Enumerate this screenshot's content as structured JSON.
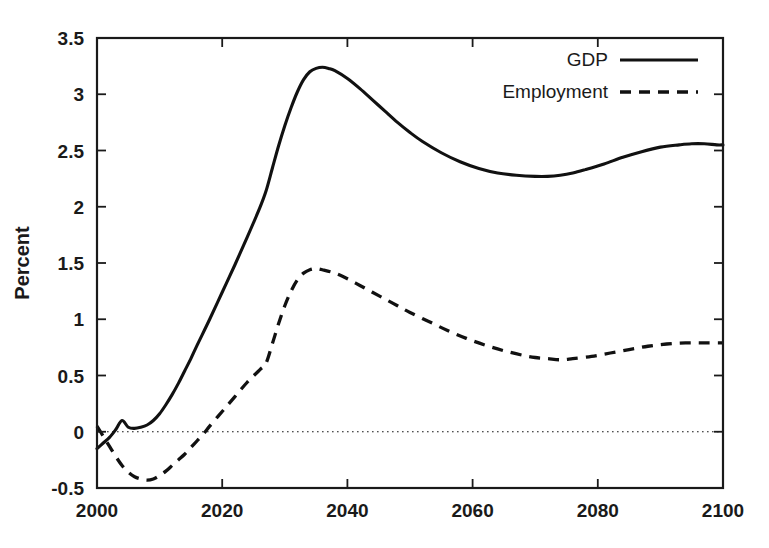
{
  "chart_data": {
    "type": "line",
    "title": "",
    "xlabel": "",
    "ylabel": "Percent",
    "xlim": [
      2000,
      2100
    ],
    "ylim": [
      -0.5,
      3.5
    ],
    "xticks": [
      2000,
      2020,
      2040,
      2060,
      2080,
      2100
    ],
    "xtick_labels": [
      "2000",
      "2020",
      "2040",
      "2060",
      "2080",
      "2100"
    ],
    "yticks": [
      -0.5,
      0,
      0.5,
      1,
      1.5,
      2,
      2.5,
      3,
      3.5
    ],
    "ytick_labels": [
      "-0.5",
      "0",
      "0.5",
      "1",
      "1.5",
      "2",
      "2.5",
      "3",
      "3.5"
    ],
    "grid": false,
    "zero_reference_line": {
      "value": 0,
      "style": "dotted"
    },
    "legend": {
      "position": "top-right",
      "entries": [
        {
          "name": "GDP",
          "style": "solid"
        },
        {
          "name": "Employment",
          "style": "dashed"
        }
      ]
    },
    "series": [
      {
        "name": "GDP",
        "style": "solid",
        "color": "#111111",
        "x": [
          2000,
          2001,
          2002,
          2003,
          2004,
          2005,
          2006,
          2007,
          2008,
          2009,
          2010,
          2011,
          2012,
          2013,
          2014,
          2015,
          2016,
          2018,
          2020,
          2022,
          2024,
          2026,
          2027,
          2028,
          2029,
          2030,
          2031,
          2032,
          2033,
          2034,
          2035,
          2036,
          2037,
          2038,
          2040,
          2042,
          2044,
          2046,
          2048,
          2050,
          2052,
          2055,
          2058,
          2061,
          2064,
          2067,
          2070,
          2072,
          2074,
          2076,
          2078,
          2081,
          2084,
          2087,
          2090,
          2093,
          2095,
          2097,
          2099,
          2100
        ],
        "y": [
          -0.15,
          -0.1,
          -0.05,
          0.02,
          0.1,
          0.04,
          0.03,
          0.04,
          0.06,
          0.1,
          0.16,
          0.24,
          0.33,
          0.43,
          0.54,
          0.65,
          0.77,
          1.0,
          1.24,
          1.48,
          1.73,
          1.99,
          2.14,
          2.34,
          2.54,
          2.72,
          2.88,
          3.02,
          3.13,
          3.2,
          3.23,
          3.24,
          3.23,
          3.21,
          3.14,
          3.05,
          2.95,
          2.85,
          2.75,
          2.66,
          2.58,
          2.48,
          2.4,
          2.34,
          2.3,
          2.28,
          2.27,
          2.27,
          2.28,
          2.3,
          2.33,
          2.38,
          2.44,
          2.49,
          2.53,
          2.55,
          2.56,
          2.56,
          2.55,
          2.55
        ]
      },
      {
        "name": "Employment",
        "style": "dashed",
        "color": "#111111",
        "x": [
          2000,
          2001,
          2002,
          2003,
          2004,
          2005,
          2006,
          2007,
          2008,
          2009,
          2010,
          2011,
          2012,
          2013,
          2014,
          2015,
          2016,
          2017,
          2018,
          2020,
          2022,
          2024,
          2026,
          2027,
          2028,
          2029,
          2030,
          2031,
          2032,
          2033,
          2034,
          2035,
          2036,
          2038,
          2040,
          2042,
          2044,
          2046,
          2048,
          2050,
          2053,
          2056,
          2059,
          2062,
          2065,
          2068,
          2070,
          2072,
          2074,
          2076,
          2079,
          2082,
          2085,
          2088,
          2091,
          2094,
          2097,
          2100
        ],
        "y": [
          0.05,
          -0.04,
          -0.13,
          -0.22,
          -0.3,
          -0.36,
          -0.4,
          -0.42,
          -0.43,
          -0.42,
          -0.39,
          -0.35,
          -0.3,
          -0.25,
          -0.2,
          -0.14,
          -0.08,
          -0.02,
          0.05,
          0.18,
          0.31,
          0.44,
          0.55,
          0.61,
          0.78,
          0.96,
          1.12,
          1.25,
          1.35,
          1.41,
          1.44,
          1.45,
          1.44,
          1.41,
          1.36,
          1.3,
          1.24,
          1.18,
          1.12,
          1.06,
          0.98,
          0.9,
          0.83,
          0.77,
          0.72,
          0.68,
          0.66,
          0.65,
          0.64,
          0.65,
          0.67,
          0.7,
          0.73,
          0.76,
          0.78,
          0.79,
          0.79,
          0.79
        ]
      }
    ]
  }
}
